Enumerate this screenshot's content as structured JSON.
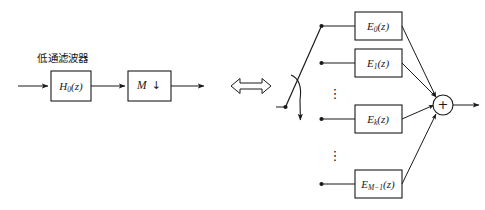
{
  "figure": {
    "background_color": "#ffffff",
    "line_color": "#1a1a1a"
  },
  "left_branch": {
    "annotation": "低通滤波器",
    "filter_box": {
      "main": "H",
      "sub": "0",
      "arg": "(z)",
      "label": "H0(z)"
    },
    "decimator_box": {
      "factor": "M",
      "arrow_glyph": "↓",
      "label": "M ↓"
    },
    "input_arrow": "input-signal-arrow",
    "output_arrow": "output-signal-arrow"
  },
  "equivalence": {
    "symbol": "⟺",
    "name": "double-headed-equivalence-arrow"
  },
  "right_branch": {
    "commutator": {
      "name": "rotating-commutator-switch",
      "arc_glyph": "rotation-arc"
    },
    "polyphase_boxes": [
      {
        "main": "E",
        "sub": "0",
        "arg": "(z)",
        "label": "E0(z)"
      },
      {
        "main": "E",
        "sub": "1",
        "arg": "(z)",
        "label": "E1(z)"
      },
      {
        "main": "E",
        "sub": "k",
        "arg": "(z)",
        "label": "Ek(z)"
      },
      {
        "main": "E",
        "sub": "M−1",
        "arg": "(z)",
        "label": "EM-1(z)"
      }
    ],
    "ellipsis_upper": "⋮",
    "ellipsis_lower": "⋮",
    "adder": {
      "symbol": "+",
      "name": "summing-junction"
    },
    "output_arrow": "combined-output-arrow"
  }
}
